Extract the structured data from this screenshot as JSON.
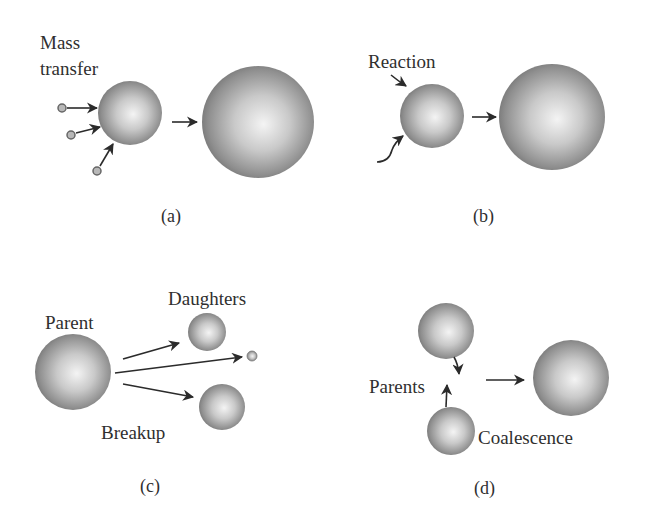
{
  "panels": {
    "a": {
      "caption": "(a)",
      "label_line1": "Mass",
      "label_line2": "transfer",
      "process": "Mass transfer"
    },
    "b": {
      "caption": "(b)",
      "label": "Reaction"
    },
    "c": {
      "caption": "(c)",
      "parent_label": "Parent",
      "daughters_label": "Daughters",
      "process_label": "Breakup"
    },
    "d": {
      "caption": "(d)",
      "parents_label": "Parents",
      "process_label": "Coalescence"
    }
  },
  "colors": {
    "sphere_dark": "#7a7a7a",
    "sphere_light": "#f2f2f2",
    "arrow": "#2b2b2b",
    "text": "#2f2f2f",
    "background": "#ffffff"
  }
}
